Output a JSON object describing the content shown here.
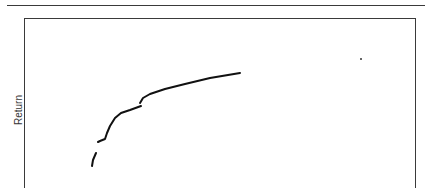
{
  "chart_data": {
    "type": "line",
    "title": "",
    "xlabel": "",
    "ylabel": "Return",
    "grid": false,
    "legend": null,
    "series": [
      {
        "name": "return-curve",
        "color": "#111111",
        "segments": [
          [
            [
              92,
              166
            ],
            [
              93,
              160
            ],
            [
              96,
              153
            ]
          ],
          [
            [
              98,
              142
            ],
            [
              100,
              141
            ],
            [
              105,
              139
            ],
            [
              107,
              133
            ],
            [
              110,
              126
            ],
            [
              115,
              118
            ],
            [
              121,
              113
            ],
            [
              130,
              110
            ],
            [
              141,
              106
            ]
          ],
          [
            [
              140,
              103
            ],
            [
              143,
              98
            ],
            [
              150,
              94
            ],
            [
              165,
              89
            ],
            [
              185,
              84
            ],
            [
              210,
              78
            ],
            [
              240,
              73
            ]
          ]
        ]
      }
    ],
    "annotations": [
      {
        "type": "point",
        "x": 361,
        "y": 59
      }
    ]
  },
  "labels": {
    "y_axis": "Return"
  },
  "colors": {
    "frame": "#3a3a3a",
    "line": "#111111"
  }
}
